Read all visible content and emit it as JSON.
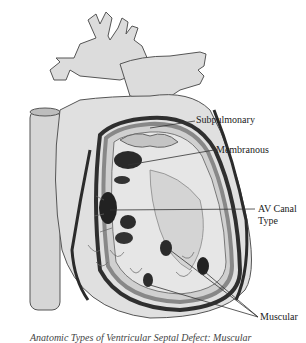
{
  "figure": {
    "colors": {
      "outline": "#555555",
      "fill_light": "#dcdcdc",
      "fill_mid": "#c8c8c8",
      "defect_dark": "#2a2a2a",
      "band": "#9a9a9a",
      "background": "#ffffff"
    }
  },
  "labels": {
    "subpulmonary": "Subpulmonary",
    "membranous": "Membranous",
    "av_canal_line1": "AV Canal",
    "av_canal_line2": "Type",
    "muscular": "Muscular"
  },
  "caption": "Anatomic Types of Ventricular Septal Defect: Muscular"
}
